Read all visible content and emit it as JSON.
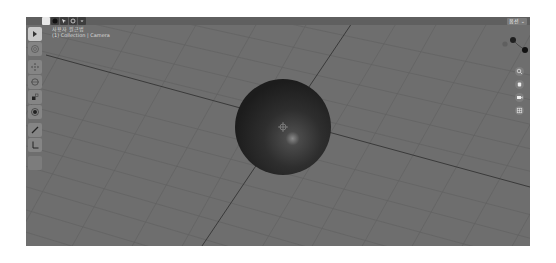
{
  "viewport": {
    "view_name": "사용자 원근법",
    "collection_info": "(1) Collection | Camera",
    "view_selector": "옵션 ⌄",
    "colors": {
      "background": "#6e6e6e",
      "grid_line": "#626262",
      "x_axis": "#3a3a3a",
      "y_axis": "#3a3a3a",
      "sphere": "#2a2a2a"
    }
  },
  "header": {
    "mode_buttons": [
      {
        "name": "select-box-icon",
        "active": true
      },
      {
        "name": "viewport-shading-icon",
        "active": false
      },
      {
        "name": "selection-mode-icon",
        "active": false
      },
      {
        "name": "overlay-icon",
        "active": false
      },
      {
        "name": "dropdown-icon",
        "active": false
      }
    ]
  },
  "toolbar": {
    "tools": [
      {
        "name": "select-tool",
        "icon": "cursor-icon",
        "active": true
      },
      {
        "name": "cursor-tool",
        "icon": "3d-cursor-icon",
        "active": false
      },
      {
        "name": "move-tool",
        "icon": "move-icon",
        "active": false
      },
      {
        "name": "rotate-tool",
        "icon": "rotate-icon",
        "active": false
      },
      {
        "name": "scale-tool",
        "icon": "scale-icon",
        "active": false
      },
      {
        "name": "transform-tool",
        "icon": "transform-icon",
        "active": false
      },
      {
        "name": "annotate-tool",
        "icon": "pencil-icon",
        "active": false
      },
      {
        "name": "measure-tool",
        "icon": "ruler-icon",
        "active": false
      },
      {
        "name": "extra-tool",
        "icon": "blank-icon",
        "active": false
      }
    ]
  },
  "navigation": {
    "buttons": [
      {
        "name": "zoom-button",
        "icon": "magnifier-icon"
      },
      {
        "name": "pan-button",
        "icon": "hand-icon"
      },
      {
        "name": "camera-view-button",
        "icon": "camera-icon"
      },
      {
        "name": "ortho-toggle-button",
        "icon": "grid-icon"
      }
    ]
  },
  "gizmo": {
    "axes": [
      "X",
      "Y",
      "Z"
    ]
  }
}
